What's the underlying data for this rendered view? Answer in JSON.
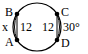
{
  "diagram": {
    "points": [
      {
        "name": "B",
        "x": 17,
        "y": 14
      },
      {
        "name": "A",
        "x": 17,
        "y": 40
      },
      {
        "name": "C",
        "x": 57,
        "y": 14
      },
      {
        "name": "D",
        "x": 57,
        "y": 40
      }
    ],
    "labels": {
      "B": "B",
      "A": "A",
      "C": "C",
      "D": "D",
      "x": "x",
      "chord_left": "12",
      "chord_right": "12",
      "angle": "30°"
    },
    "colors": {
      "stroke": "#000000",
      "background": "#ffffff"
    }
  }
}
